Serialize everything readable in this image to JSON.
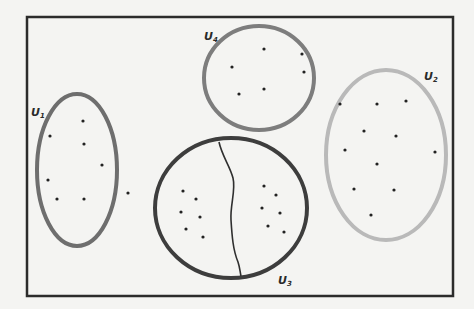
{
  "diagram": {
    "frame": {
      "x": 27,
      "y": 17,
      "width": 426,
      "height": 279,
      "color": "#2b2b2b"
    },
    "sets": [
      {
        "id": "U1",
        "label": "U",
        "subscript": "1",
        "cx": 77,
        "cy": 170,
        "rx": 40,
        "ry": 76,
        "stroke": "#6e6e6e",
        "stroke_width": 4,
        "label_x": 31,
        "label_y": 116,
        "points": [
          [
            83,
            121
          ],
          [
            50,
            136
          ],
          [
            84,
            144
          ],
          [
            102,
            165
          ],
          [
            48,
            180
          ],
          [
            57,
            199
          ],
          [
            84,
            199
          ],
          [
            128,
            193
          ]
        ]
      },
      {
        "id": "U2",
        "label": "U",
        "subscript": "2",
        "cx": 386,
        "cy": 155,
        "rx": 60,
        "ry": 85,
        "stroke": "#b9b9b9",
        "stroke_width": 4,
        "label_x": 424,
        "label_y": 80,
        "points": [
          [
            340,
            104
          ],
          [
            377,
            104
          ],
          [
            406,
            101
          ],
          [
            364,
            131
          ],
          [
            396,
            136
          ],
          [
            345,
            150
          ],
          [
            377,
            164
          ],
          [
            435,
            152
          ],
          [
            354,
            189
          ],
          [
            394,
            190
          ],
          [
            371,
            215
          ]
        ]
      },
      {
        "id": "U3",
        "label": "U",
        "subscript": "3",
        "cx": 231,
        "cy": 208,
        "rx": 76,
        "ry": 70,
        "stroke": "#3d3d3d",
        "stroke_width": 4,
        "label_x": 278,
        "label_y": 284,
        "points": [
          [
            183,
            191
          ],
          [
            196,
            199
          ],
          [
            181,
            212
          ],
          [
            200,
            217
          ],
          [
            186,
            229
          ],
          [
            203,
            237
          ],
          [
            264,
            186
          ],
          [
            276,
            195
          ],
          [
            262,
            208
          ],
          [
            280,
            213
          ],
          [
            268,
            226
          ],
          [
            284,
            232
          ]
        ]
      },
      {
        "id": "U4",
        "label": "U",
        "subscript": "4",
        "cx": 259,
        "cy": 78,
        "rx": 55,
        "ry": 52,
        "stroke": "#7d7d7d",
        "stroke_width": 4,
        "label_x": 204,
        "label_y": 40,
        "points": [
          [
            264,
            49
          ],
          [
            302,
            54
          ],
          [
            232,
            67
          ],
          [
            304,
            72
          ],
          [
            239,
            94
          ],
          [
            264,
            89
          ]
        ]
      }
    ],
    "partition_curve": {
      "stroke": "#2f2f2f",
      "path": "M219,142 C222,156 230,166 233,178 C236,190 230,205 231,220 C232,236 233,250 238,262 C240,268 240,272 241,276"
    }
  }
}
